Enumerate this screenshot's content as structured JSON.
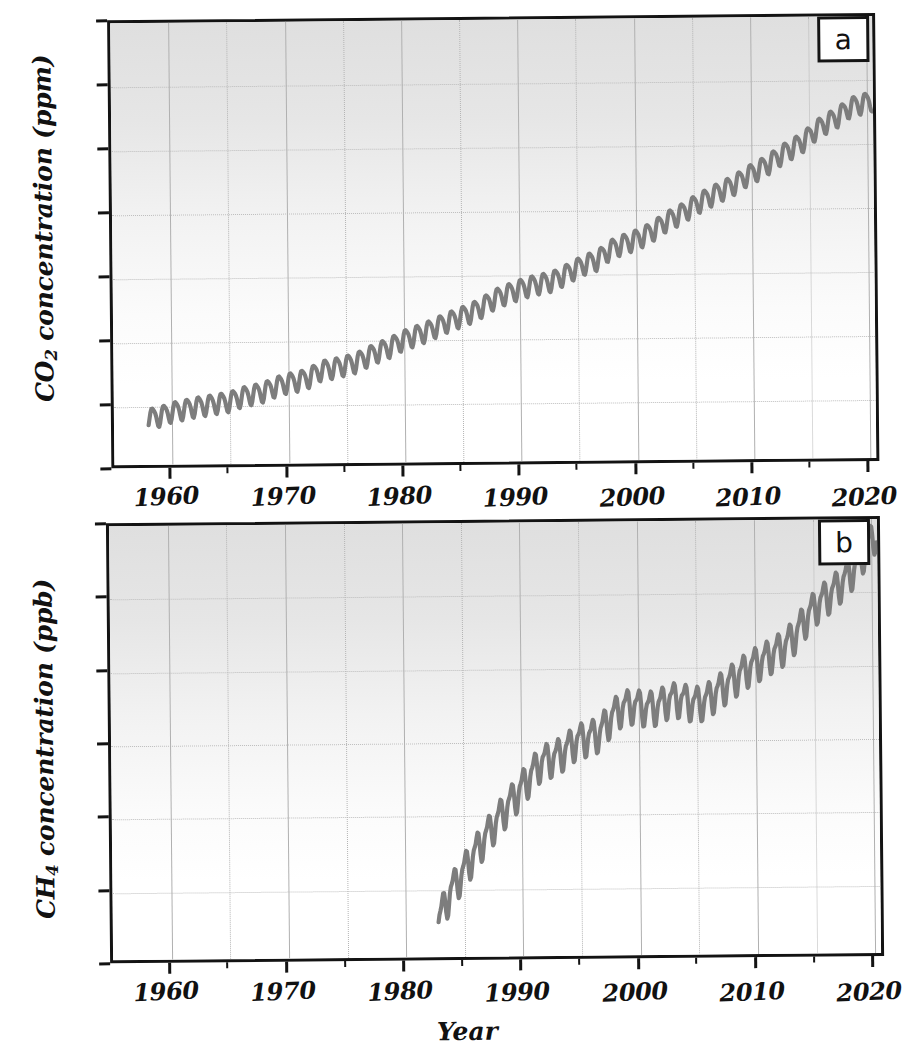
{
  "figure": {
    "panels": [
      {
        "letter": "a",
        "ylabel_prefix": "CO",
        "ylabel_sub": "2",
        "ylabel_suffix": " concentration (ppm)",
        "yticks": [
          "440",
          "420",
          "400",
          "380",
          "360",
          "340",
          "320",
          "300"
        ],
        "xticks": [
          "1960",
          "1970",
          "1980",
          "1990",
          "2000",
          "2010",
          "2020"
        ]
      },
      {
        "letter": "b",
        "ylabel_prefix": "CH",
        "ylabel_sub": "4",
        "ylabel_suffix": " concentration (ppb)",
        "yticks": [
          "1900",
          "1850",
          "1800",
          "1750",
          "1700",
          "1650",
          "1600"
        ],
        "xticks": [
          "1960",
          "1970",
          "1980",
          "1990",
          "2000",
          "2010",
          "2020"
        ]
      }
    ],
    "xtitle": "Year",
    "line_color": "#7d7d7d",
    "axis_color": "#131313",
    "grid_color": "#b9b9b9"
  },
  "chart_data": [
    {
      "type": "line",
      "title": "",
      "panel": "a",
      "xlabel": "Year",
      "ylabel": "CO2 concentration (ppm)",
      "xlim": [
        1955,
        2021
      ],
      "ylim": [
        300,
        440
      ],
      "yticks": [
        300,
        320,
        340,
        360,
        380,
        400,
        420,
        440
      ],
      "xticks": [
        1960,
        1970,
        1980,
        1990,
        2000,
        2010,
        2020
      ],
      "grid": true,
      "legend": "none",
      "seasonal_amplitude_ppm": 6,
      "description": "Keeling curve: monthly mean atmospheric CO2 with annual seasonal cycle superimposed on rising trend",
      "series": [
        {
          "name": "CO2 annual mean",
          "x": [
            1958,
            1959,
            1960,
            1961,
            1962,
            1963,
            1964,
            1965,
            1966,
            1967,
            1968,
            1969,
            1970,
            1971,
            1972,
            1973,
            1974,
            1975,
            1976,
            1977,
            1978,
            1979,
            1980,
            1981,
            1982,
            1983,
            1984,
            1985,
            1986,
            1987,
            1988,
            1989,
            1990,
            1991,
            1992,
            1993,
            1994,
            1995,
            1996,
            1997,
            1998,
            1999,
            2000,
            2001,
            2002,
            2003,
            2004,
            2005,
            2006,
            2007,
            2008,
            2009,
            2010,
            2011,
            2012,
            2013,
            2014,
            2015,
            2016,
            2017,
            2018,
            2019,
            2020
          ],
          "values": [
            315.0,
            315.6,
            316.9,
            317.6,
            318.4,
            318.9,
            319.5,
            320.0,
            321.4,
            322.2,
            323.0,
            324.6,
            325.7,
            326.3,
            327.5,
            329.7,
            330.2,
            331.1,
            332.0,
            333.8,
            335.4,
            336.8,
            338.8,
            340.1,
            341.4,
            343.0,
            344.6,
            346.0,
            347.4,
            349.2,
            351.6,
            353.1,
            354.4,
            355.6,
            356.4,
            357.1,
            358.8,
            360.8,
            362.6,
            363.7,
            366.7,
            368.4,
            369.6,
            371.1,
            373.2,
            375.8,
            377.5,
            379.8,
            381.9,
            383.8,
            385.6,
            387.4,
            389.9,
            391.7,
            393.9,
            396.5,
            398.6,
            400.8,
            404.2,
            406.5,
            408.5,
            411.4,
            412.4
          ]
        }
      ]
    },
    {
      "type": "line",
      "title": "",
      "panel": "b",
      "xlabel": "Year",
      "ylabel": "CH4 concentration (ppb)",
      "xlim": [
        1955,
        2021
      ],
      "ylim": [
        1600,
        1900
      ],
      "yticks": [
        1600,
        1650,
        1700,
        1750,
        1800,
        1850,
        1900
      ],
      "xticks": [
        1960,
        1970,
        1980,
        1990,
        2000,
        2010,
        2020
      ],
      "grid": true,
      "legend": "none",
      "seasonal_amplitude_ppb": 28,
      "description": "Globally averaged atmospheric CH4 from 1983, rapid rise to ~1775 ppb by 1999, plateau 1999-2006, renewed growth to ~1855 ppb by 2020",
      "series": [
        {
          "name": "CH4 annual mean",
          "x": [
            1983,
            1984,
            1985,
            1986,
            1987,
            1988,
            1989,
            1990,
            1991,
            1992,
            1993,
            1994,
            1995,
            1996,
            1997,
            1998,
            1999,
            2000,
            2001,
            2002,
            2003,
            2004,
            2005,
            2006,
            2007,
            2008,
            2009,
            2010,
            2011,
            2012,
            2013,
            2014,
            2015,
            2016,
            2017,
            2018,
            2019,
            2020
          ],
          "values": [
            1625,
            1645,
            1657,
            1670,
            1682,
            1693,
            1704,
            1714,
            1725,
            1735,
            1737,
            1742,
            1749,
            1751,
            1754,
            1765,
            1772,
            1773,
            1771,
            1772,
            1777,
            1777,
            1774,
            1775,
            1781,
            1787,
            1793,
            1799,
            1803,
            1808,
            1813,
            1822,
            1834,
            1843,
            1849,
            1857,
            1866,
            1879
          ]
        }
      ]
    }
  ]
}
